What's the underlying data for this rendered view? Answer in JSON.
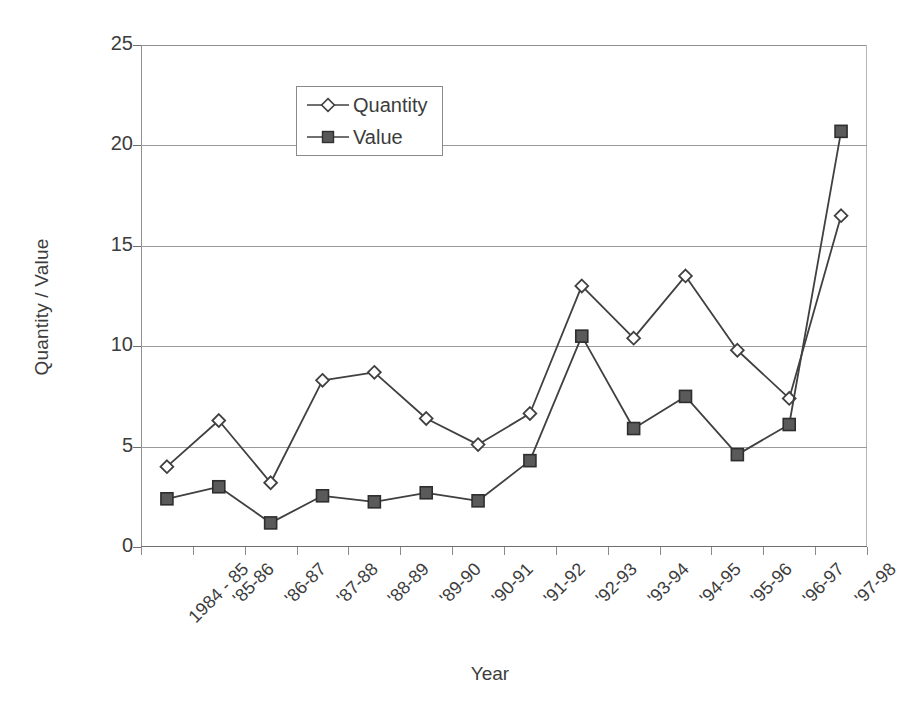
{
  "chart_data": {
    "type": "line",
    "title": "",
    "xlabel": "Year",
    "ylabel": "Quantity / Value",
    "ylim": [
      0,
      25
    ],
    "yticks": [
      0,
      5,
      10,
      15,
      20,
      25
    ],
    "ytick_labels": [
      "0",
      "5",
      "10",
      "15",
      "20",
      "25"
    ],
    "grid": true,
    "legend_position": "upper-left-inside",
    "categories": [
      "1984 - 85",
      "'85-86",
      "'86-87",
      "'87-88",
      "'88-89",
      "'89-90",
      "'90-91",
      "'91-92",
      "'92-93",
      "'93-94",
      "'94-95",
      "'95-96",
      "'96-97",
      "'97-98"
    ],
    "series": [
      {
        "name": "Quantity",
        "marker": "open-diamond",
        "color": "#404040",
        "values": [
          4.0,
          6.3,
          3.2,
          8.3,
          8.7,
          6.4,
          5.1,
          6.65,
          13.0,
          10.4,
          13.5,
          9.8,
          7.4,
          16.5
        ]
      },
      {
        "name": "Value",
        "marker": "filled-square",
        "color": "#404040",
        "values": [
          2.4,
          3.0,
          1.2,
          2.55,
          2.25,
          2.7,
          2.3,
          4.3,
          10.5,
          5.9,
          7.5,
          4.6,
          6.1,
          20.7
        ]
      }
    ]
  },
  "legend": {
    "items": [
      {
        "label": "Quantity"
      },
      {
        "label": "Value"
      }
    ]
  },
  "axes": {
    "y_title": "Quantity / Value",
    "x_title": "Year"
  }
}
